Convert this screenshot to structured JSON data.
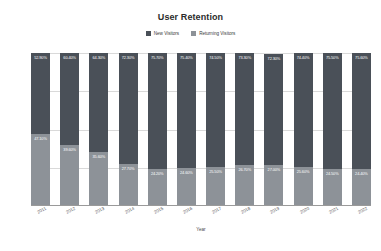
{
  "chart_data": {
    "type": "bar",
    "subtype": "stacked-100-percent",
    "title": "User Retention",
    "xlabel": "Year",
    "ylabel": "",
    "ylim": [
      0,
      100
    ],
    "ytick_labels": [
      "100%",
      "75%",
      "50%",
      "25%",
      "0%"
    ],
    "ytick_values": [
      100,
      75,
      50,
      25,
      0
    ],
    "grid": true,
    "legend_position": "top-center",
    "categories": [
      "2011",
      "2012",
      "2013",
      "2014",
      "2015",
      "2016",
      "2017",
      "2018",
      "2019",
      "2020",
      "2021",
      "2022"
    ],
    "series": [
      {
        "name": "New Visitors",
        "color": "#4a5058",
        "values": [
          52.9,
          60.4,
          64.3,
          72.3,
          75.7,
          75.4,
          74.5,
          73.3,
          72.3,
          74.4,
          75.5,
          75.6
        ],
        "value_labels": [
          "52.90%",
          "60.40%",
          "64.30%",
          "72.30%",
          "75.70%",
          "75.40%",
          "74.50%",
          "73.30%",
          "72.30%",
          "74.40%",
          "75.50%",
          "75.60%"
        ]
      },
      {
        "name": "Returning Visitors",
        "color": "#8d9298",
        "values": [
          47.1,
          39.6,
          35.6,
          27.7,
          24.2,
          24.6,
          25.5,
          26.7,
          27.0,
          25.6,
          24.5,
          24.4
        ],
        "value_labels": [
          "47.10%",
          "39.60%",
          "35.60%",
          "27.70%",
          "24.20%",
          "24.60%",
          "25.50%",
          "26.70%",
          "27.00%",
          "25.60%",
          "24.50%",
          "24.40%"
        ]
      }
    ]
  }
}
